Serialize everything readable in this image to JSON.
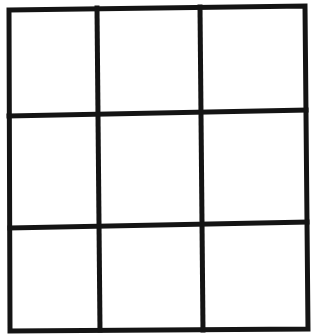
{
  "diagram": {
    "type": "grid",
    "rows": 3,
    "columns": 3,
    "line_color": "#141414",
    "background_color": "#ffffff",
    "cells": [
      [
        "",
        "",
        ""
      ],
      [
        "",
        "",
        ""
      ],
      [
        "",
        "",
        ""
      ]
    ]
  }
}
